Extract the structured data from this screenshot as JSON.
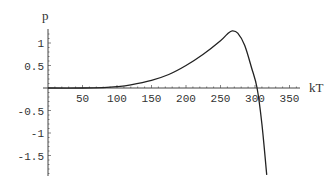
{
  "chart_data": {
    "type": "line",
    "title": "",
    "xlabel": "kT",
    "ylabel": "p",
    "xlim": [
      0,
      360
    ],
    "ylim": [
      -1.95,
      1.3
    ],
    "grid": false,
    "legend": null,
    "x_ticks": [
      50,
      100,
      150,
      200,
      250,
      300,
      350
    ],
    "x_tick_labels": [
      "50",
      "100",
      "150",
      "200",
      "250",
      "300",
      "350"
    ],
    "y_ticks": [
      1,
      0.5,
      -0.5,
      -1,
      -1.5
    ],
    "y_tick_labels": [
      "1",
      "0.5",
      "-0.5",
      "-1",
      "-1.5"
    ],
    "series": [
      {
        "name": "p(kT)",
        "color": "#222222",
        "x": [
          0,
          50,
          80,
          100,
          120,
          150,
          175,
          200,
          225,
          250,
          260,
          267,
          275,
          285,
          295,
          303,
          310,
          317
        ],
        "y": [
          0,
          0.0,
          0.01,
          0.03,
          0.07,
          0.17,
          0.3,
          0.5,
          0.75,
          1.05,
          1.2,
          1.27,
          1.22,
          0.95,
          0.45,
          0.0,
          -0.8,
          -1.93
        ]
      }
    ]
  },
  "axes": {
    "x_label": "kT",
    "y_label": "p"
  }
}
